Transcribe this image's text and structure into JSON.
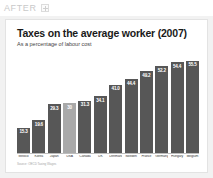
{
  "header": {
    "label": "AFTER",
    "badge_icon": "plus-icon"
  },
  "slide": {
    "title": "Taxes on the average worker (2007)",
    "subtitle": "As a percentage of labour cost",
    "source": "Source: OECD Taxing Wages"
  },
  "colors": {
    "bar": "#575757",
    "bar_highlight": "#a9a9a9",
    "slide_background": "#ffffff",
    "page_background": "#f2f2f2",
    "after_text": "#c9c9c9"
  },
  "chart_data": {
    "type": "bar",
    "title": "Taxes on the average worker (2007)",
    "subtitle": "As a percentage of labour cost",
    "xlabel": "",
    "ylabel": "",
    "ylim": [
      0,
      60
    ],
    "grid": false,
    "legend": "none",
    "highlight_category": "USA",
    "categories": [
      "Mexico",
      "Korea",
      "Japan",
      "USA",
      "Canada",
      "UK",
      "Denmark",
      "Sweden",
      "France",
      "Germany",
      "Hungary",
      "Belgium"
    ],
    "values": [
      15.3,
      19.6,
      29.3,
      30.0,
      31.3,
      34.1,
      41.0,
      44.4,
      49.2,
      52.2,
      54.4,
      55.5
    ],
    "value_labels": [
      "15.3",
      "19.6",
      "29.3",
      "30",
      "31.3",
      "34.1",
      "41.0",
      "44.4",
      "49.2",
      "52.2",
      "54.4",
      "55.5"
    ]
  }
}
